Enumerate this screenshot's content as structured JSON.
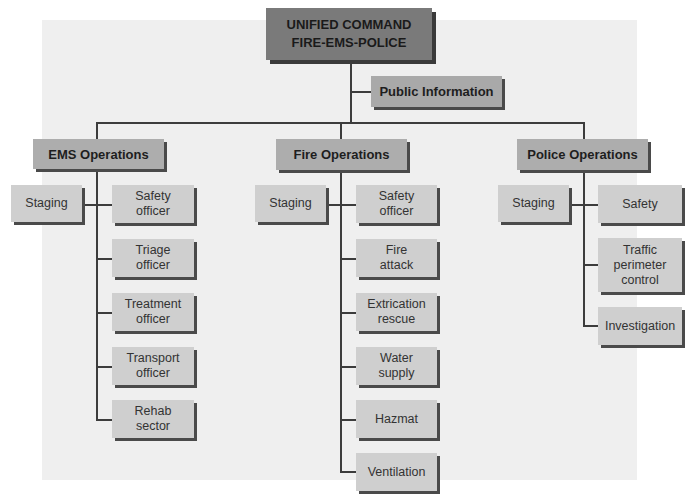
{
  "diagram": {
    "type": "org-chart",
    "colors": {
      "background_panel": "#efefef",
      "command_box": "#7a7a7a",
      "section_header_box": "#adadad",
      "public_information_box": "#a9a9a9",
      "unit_box": "#cfcfcf",
      "connector": "#3c3c3c",
      "shadow": "#4a4a4a"
    },
    "command": {
      "label": "UNIFIED COMMAND\nFIRE-EMS-POLICE"
    },
    "public_information": {
      "label": "Public Information"
    },
    "sections": [
      {
        "id": "ems",
        "label": "EMS Operations",
        "staging": "Staging",
        "units": [
          "Safety\nofficer",
          "Triage\nofficer",
          "Treatment\nofficer",
          "Transport\nofficer",
          "Rehab\nsector"
        ]
      },
      {
        "id": "fire",
        "label": "Fire Operations",
        "staging": "Staging",
        "units": [
          "Safety\nofficer",
          "Fire\nattack",
          "Extrication\nrescue",
          "Water\nsupply",
          "Hazmat",
          "Ventilation"
        ]
      },
      {
        "id": "police",
        "label": "Police Operations",
        "staging": "Staging",
        "units": [
          "Safety",
          "Traffic\nperimeter\ncontrol",
          "Investigation"
        ]
      }
    ],
    "edges": [
      [
        "UNIFIED COMMAND",
        "Public Information"
      ],
      [
        "UNIFIED COMMAND",
        "EMS Operations"
      ],
      [
        "UNIFIED COMMAND",
        "Fire Operations"
      ],
      [
        "UNIFIED COMMAND",
        "Police Operations"
      ],
      [
        "EMS Operations",
        "Staging"
      ],
      [
        "EMS Operations",
        "Safety officer"
      ],
      [
        "EMS Operations",
        "Triage officer"
      ],
      [
        "EMS Operations",
        "Treatment officer"
      ],
      [
        "EMS Operations",
        "Transport officer"
      ],
      [
        "EMS Operations",
        "Rehab sector"
      ],
      [
        "Fire Operations",
        "Staging"
      ],
      [
        "Fire Operations",
        "Safety officer"
      ],
      [
        "Fire Operations",
        "Fire attack"
      ],
      [
        "Fire Operations",
        "Extrication rescue"
      ],
      [
        "Fire Operations",
        "Water supply"
      ],
      [
        "Fire Operations",
        "Hazmat"
      ],
      [
        "Fire Operations",
        "Ventilation"
      ],
      [
        "Police Operations",
        "Staging"
      ],
      [
        "Police Operations",
        "Safety"
      ],
      [
        "Police Operations",
        "Traffic perimeter control"
      ],
      [
        "Police Operations",
        "Investigation"
      ]
    ]
  }
}
